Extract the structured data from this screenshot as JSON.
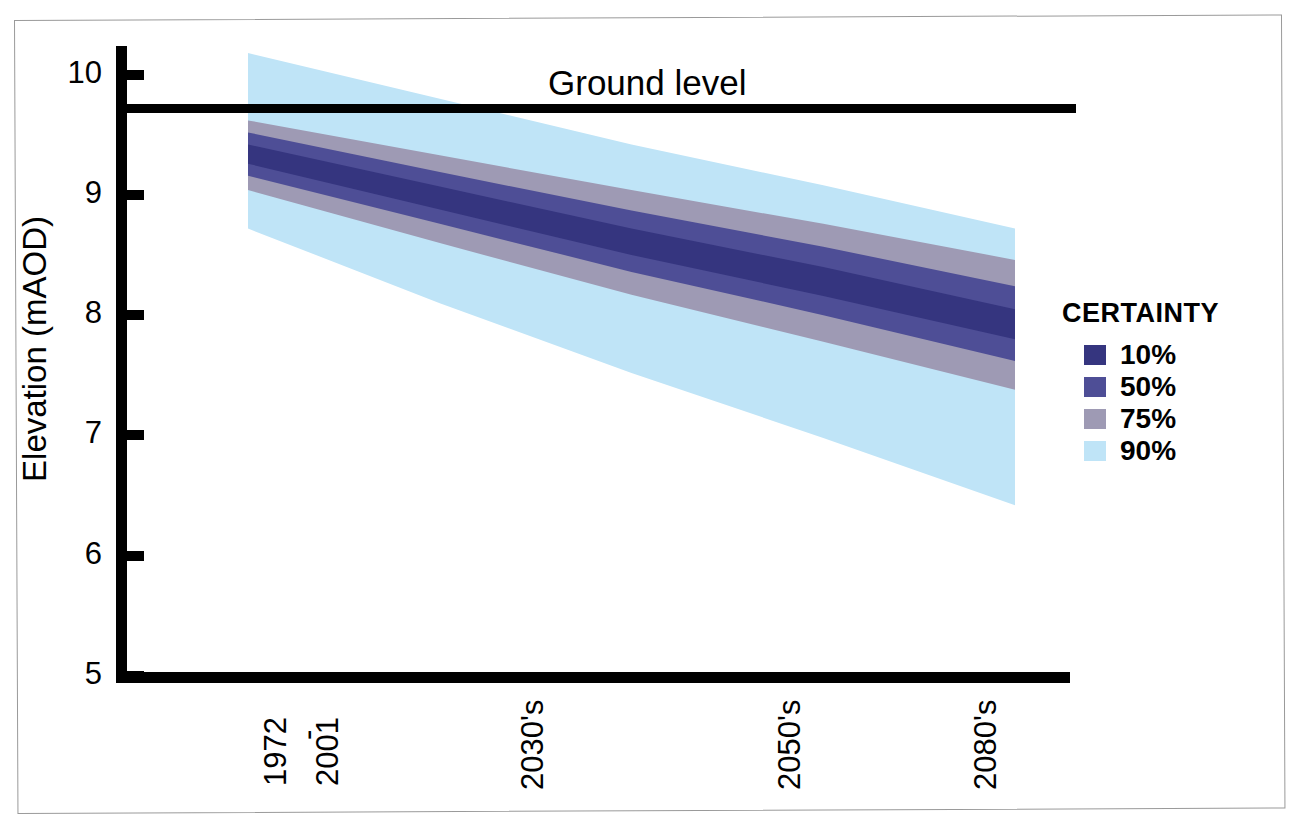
{
  "chart_data": {
    "type": "area",
    "title": "",
    "xlabel": "",
    "ylabel": "Elevation (mAOD)",
    "ylim": [
      5,
      10.2
    ],
    "yticks": [
      10,
      9,
      8,
      7,
      6,
      5
    ],
    "ytick_labels": [
      "10",
      "9",
      "8",
      "7",
      "6",
      "5"
    ],
    "grid": false,
    "legend_position": "right",
    "categories": [
      "1972 - 2001",
      "2030's",
      "2050's",
      "2080's"
    ],
    "x_positions": [
      0,
      0.32,
      0.62,
      0.86
    ],
    "annotations": [
      {
        "name": "ground-level",
        "label": "Ground level",
        "y_value": 9.54,
        "style": "horizontal-line"
      }
    ],
    "series": [
      {
        "name": "10%",
        "certainty": "10%",
        "color": "#35357f",
        "upper": [
          9.42,
          9.07,
          8.72,
          8.4,
          8.05
        ],
        "lower": [
          9.26,
          8.88,
          8.5,
          8.16,
          7.8
        ]
      },
      {
        "name": "50%",
        "certainty": "50%",
        "color": "#4e4e96",
        "upper": [
          9.52,
          9.19,
          8.87,
          8.57,
          8.24
        ],
        "lower": [
          9.16,
          8.76,
          8.36,
          8.0,
          7.62
        ]
      },
      {
        "name": "75%",
        "certainty": "75%",
        "color": "#9e9ab4",
        "upper": [
          9.62,
          9.33,
          9.04,
          8.76,
          8.46
        ],
        "lower": [
          9.04,
          8.6,
          8.17,
          7.78,
          7.38
        ]
      },
      {
        "name": "90%",
        "certainty": "90%",
        "color": "#bfe4f7",
        "upper": [
          10.18,
          9.8,
          9.42,
          9.08,
          8.72
        ],
        "lower": [
          8.72,
          8.1,
          7.52,
          6.98,
          6.42
        ]
      }
    ]
  },
  "axes": {
    "y_title": "Elevation (mAOD)",
    "y_ticks": [
      "10",
      "9",
      "8",
      "7",
      "6",
      "5"
    ],
    "x_ticks": [
      {
        "id": "baseline",
        "line1": "1972",
        "dash": "-",
        "line2": "2001"
      },
      {
        "id": "2030s",
        "label": "2030's"
      },
      {
        "id": "2050s",
        "label": "2050's"
      },
      {
        "id": "2080s",
        "label": "2080's"
      }
    ]
  },
  "annotation": {
    "ground_level_label": "Ground level"
  },
  "legend": {
    "title": "CERTAINTY",
    "items": [
      {
        "label": "10%",
        "color": "#35357f"
      },
      {
        "label": "50%",
        "color": "#4e4e96"
      },
      {
        "label": "75%",
        "color": "#9e9ab4"
      },
      {
        "label": "90%",
        "color": "#bfe4f7"
      }
    ]
  }
}
